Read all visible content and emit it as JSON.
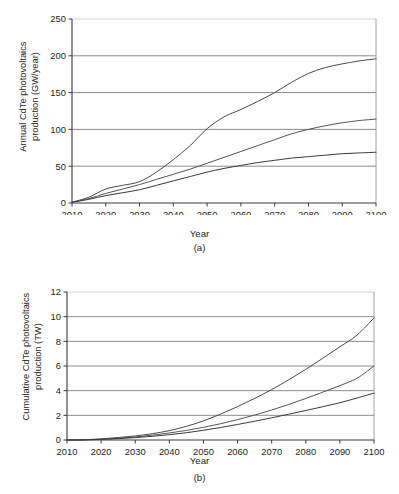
{
  "figure": {
    "panels": [
      {
        "id": "a",
        "caption": "(a)",
        "xlabel": "Year",
        "ylabel_line1": "Annual CdTe photovoltaics",
        "ylabel_line2": "production (GW/year)"
      },
      {
        "id": "b",
        "caption": "(b)",
        "xlabel": "Year",
        "ylabel_line1": "Cumulative CdTe photovoltaics",
        "ylabel_line2": "production (TW)"
      }
    ]
  },
  "chart_data": [
    {
      "type": "line",
      "panel": "a",
      "title": "",
      "xlabel": "Year",
      "ylabel": "Annual CdTe photovoltaics production (GW/year)",
      "xlim": [
        2010,
        2100
      ],
      "ylim": [
        0,
        250
      ],
      "xticks": [
        2010,
        2020,
        2030,
        2040,
        2050,
        2060,
        2070,
        2080,
        2090,
        2100
      ],
      "yticks": [
        0,
        50,
        100,
        150,
        200,
        250
      ],
      "xticklabels": [
        "2010",
        "2020",
        "2030",
        "2040",
        "2050",
        "2060",
        "2070",
        "2080",
        "2090",
        "2100"
      ],
      "yticklabels": [
        "0",
        "50",
        "100",
        "150",
        "200",
        "250"
      ],
      "grid": "horizontal",
      "legend": "none",
      "x": [
        2010,
        2015,
        2020,
        2025,
        2030,
        2035,
        2040,
        2045,
        2050,
        2055,
        2060,
        2065,
        2070,
        2075,
        2080,
        2085,
        2090,
        2095,
        2100
      ],
      "series": [
        {
          "name": "high-growth scenario",
          "color": "#4a4a4a",
          "values": [
            1,
            8,
            19,
            24,
            29,
            42,
            59,
            78,
            101,
            117,
            127,
            138,
            150,
            164,
            176,
            184,
            189,
            193,
            196
          ]
        },
        {
          "name": "medium-growth scenario",
          "color": "#555555",
          "values": [
            1,
            6,
            13,
            19,
            25,
            32,
            39,
            46,
            54,
            62,
            70,
            78,
            86,
            94,
            100,
            105,
            109,
            112,
            114
          ]
        },
        {
          "name": "low-growth scenario",
          "color": "#3a3a3a",
          "values": [
            1,
            5,
            10,
            14,
            18,
            24,
            30,
            36,
            42,
            47,
            51,
            55,
            58,
            61,
            63,
            65,
            67,
            68,
            69
          ]
        }
      ]
    },
    {
      "type": "line",
      "panel": "b",
      "title": "",
      "xlabel": "Year",
      "ylabel": "Cumulative CdTe photovoltaics production (TW)",
      "xlim": [
        2010,
        2100
      ],
      "ylim": [
        0,
        12
      ],
      "xticks": [
        2010,
        2020,
        2030,
        2040,
        2050,
        2060,
        2070,
        2080,
        2090,
        2100
      ],
      "yticks": [
        0,
        2,
        4,
        6,
        8,
        10,
        12
      ],
      "xticklabels": [
        "2010",
        "2020",
        "2030",
        "2040",
        "2050",
        "2060",
        "2070",
        "2080",
        "2090",
        "2100"
      ],
      "yticklabels": [
        "0",
        "2",
        "4",
        "6",
        "8",
        "10",
        "12"
      ],
      "grid": "horizontal",
      "legend": "none",
      "x": [
        2010,
        2015,
        2020,
        2025,
        2030,
        2035,
        2040,
        2045,
        2050,
        2055,
        2060,
        2065,
        2070,
        2075,
        2080,
        2085,
        2090,
        2095,
        2100
      ],
      "series": [
        {
          "name": "high-growth scenario",
          "color": "#4a4a4a",
          "values": [
            0.0,
            0.02,
            0.09,
            0.2,
            0.33,
            0.51,
            0.76,
            1.11,
            1.55,
            2.1,
            2.71,
            3.37,
            4.09,
            4.88,
            5.73,
            6.63,
            7.56,
            8.5,
            9.9
          ]
        },
        {
          "name": "medium-growth scenario",
          "color": "#555555",
          "values": [
            0.0,
            0.015,
            0.06,
            0.14,
            0.25,
            0.39,
            0.57,
            0.78,
            1.03,
            1.32,
            1.65,
            2.02,
            2.43,
            2.88,
            3.37,
            3.88,
            4.41,
            5.0,
            6.0
          ]
        },
        {
          "name": "low-growth scenario",
          "color": "#3a3a3a",
          "values": [
            0.0,
            0.012,
            0.05,
            0.11,
            0.19,
            0.3,
            0.43,
            0.59,
            0.79,
            1.01,
            1.26,
            1.52,
            1.8,
            2.09,
            2.39,
            2.7,
            3.02,
            3.4,
            3.8
          ]
        }
      ]
    }
  ]
}
